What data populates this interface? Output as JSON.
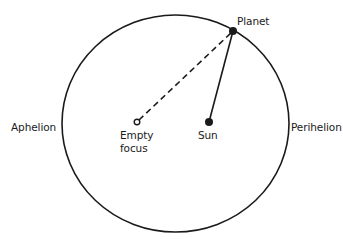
{
  "diagram": {
    "labels": {
      "planet": "Planet",
      "aphelion": "Aphelion",
      "perihelion": "Perihelion",
      "sun": "Sun",
      "empty_focus_line1": "Empty",
      "empty_focus_line2": "focus"
    },
    "colors": {
      "stroke": "#1a1a1a",
      "background": "#ffffff"
    }
  }
}
